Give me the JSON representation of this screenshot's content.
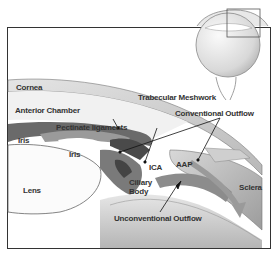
{
  "diagram": {
    "type": "anatomical-cross-section",
    "labels": {
      "cornea": "Cornea",
      "anterior_chamber": "Anterior Chamber",
      "pectinate_ligaments": "Pectinate ligaments",
      "iris_left": "Iris",
      "iris_center": "Iris",
      "lens": "Lens",
      "ciliary_body": "Ciliary Body",
      "ica": "ICA",
      "aap": "AAP",
      "trabecular_meshwork": "Trabecular Meshwork",
      "conventional_outflow": "Conventional Outflow",
      "unconventional_outflow": "Unconventional Outflow",
      "sclera": "Sclera"
    },
    "inset": {
      "description": "Whole eye globe with highlighted box over iridocorneal angle"
    },
    "colors": {
      "frame": "#333333",
      "tissue_dark": "#555555",
      "tissue_mid": "#8a8a8a",
      "tissue_light": "#c8c8c8",
      "arrow_fill": "#9a9a9a",
      "background": "#ffffff"
    }
  }
}
